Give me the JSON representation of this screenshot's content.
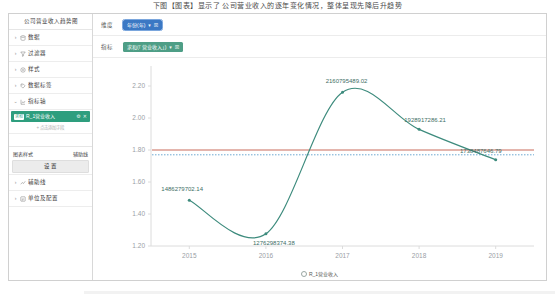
{
  "window": {
    "caption": "下图【图表】显示了 公司营业收入的逐年变化情况，整体呈现先降后升趋势"
  },
  "sidebar": {
    "title": "公司营业收入趋势图",
    "items": [
      {
        "label": "数据",
        "icon": "database-icon",
        "caret": "›"
      },
      {
        "label": "过滤器",
        "icon": "funnel-icon",
        "caret": "›"
      },
      {
        "label": "样式",
        "icon": "palette-icon",
        "caret": "›"
      },
      {
        "label": "数据标签",
        "icon": "tag-icon",
        "caret": "›"
      },
      {
        "label": "指标轴",
        "icon": "axis-icon",
        "caret": "⌄"
      }
    ],
    "selected_metric": {
      "badge": "求和",
      "label": "R_1营业收入",
      "settings_icon": "gear-icon",
      "remove_icon": "close-icon"
    },
    "add_placeholder": "+ 点击添加字段",
    "section": {
      "left_label": "图表样式",
      "right_label": "辅助线"
    },
    "settings_button": "设 置",
    "bottom_items": [
      {
        "label": "辅助线",
        "icon": "line-icon",
        "caret": "›"
      },
      {
        "label": "单位及配置",
        "icon": "config-icon",
        "caret": "›"
      }
    ]
  },
  "filters": [
    {
      "label": "维度",
      "tag": "年份(年)",
      "tag_color": "#3b78c4",
      "dropdown_icon": "chevron-down-icon",
      "close_icon": "close-icon",
      "selected": true
    },
    {
      "label": "指标",
      "tag": "求和(「营业收入」)",
      "tag_color": "#4e9e86",
      "dropdown_icon": "chevron-down-icon",
      "close_icon": "close-icon",
      "selected": false
    }
  ],
  "chart_data": {
    "type": "line",
    "title": "",
    "xlabel": "",
    "ylabel": "",
    "categories": [
      "2015",
      "2016",
      "2017",
      "2018",
      "2019"
    ],
    "x": [
      2015,
      2016,
      2017,
      2018,
      2019
    ],
    "series": [
      {
        "name": "R_1营业收入",
        "color": "#3d8b7d",
        "values": [
          1486279702.14,
          1276298374.38,
          2160795489.02,
          1928917286.21,
          1738487646.79
        ],
        "labels": [
          "1486279702.14",
          "1276298374.38",
          "2160795489.02",
          "1928917286.21",
          "1738487646.79"
        ]
      }
    ],
    "yticks": [
      "2.20",
      "2.00",
      "1.80",
      "1.60",
      "1.40",
      "1.20"
    ],
    "ytick_values": [
      2.2,
      2.0,
      1.8,
      1.6,
      1.4,
      1.2
    ],
    "ylim": [
      1.2,
      2.3
    ],
    "y_unit_scale": "1e9",
    "reference_lines": [
      {
        "name": "平均值参考线",
        "value": 1.8,
        "color": "#c96a5a",
        "style": "solid"
      },
      {
        "name": "目标值参考线",
        "value": 1.77,
        "color": "#6da9d2",
        "style": "dotted"
      }
    ],
    "grid": false,
    "legend_position": "bottom",
    "legend": [
      "R_1营业收入"
    ]
  }
}
